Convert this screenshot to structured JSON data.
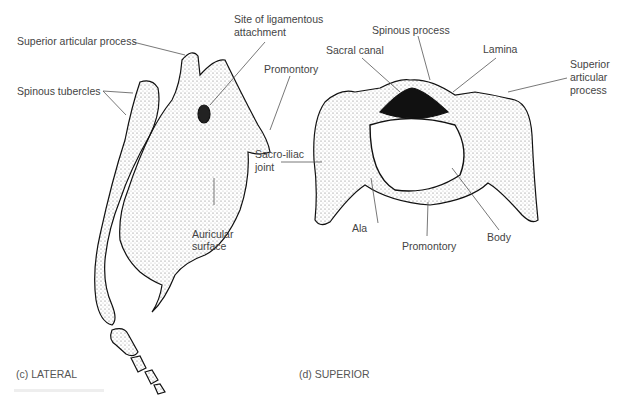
{
  "figure": {
    "panels": [
      {
        "id": "c",
        "caption": "(c) LATERAL",
        "labels": {
          "superior_articular_process": "Superior articular process",
          "site_ligamentous_line1": "Site of ligamentous",
          "site_ligamentous_line2": "attachment",
          "promontory": "Promontory",
          "spinous_tubercles": "Spinous tubercles",
          "auricular_line1": "Auricular",
          "auricular_line2": "surface"
        }
      },
      {
        "id": "d",
        "caption": "(d) SUPERIOR",
        "labels": {
          "spinous_process": "Spinous process",
          "sacral_canal": "Sacral canal",
          "lamina": "Lamina",
          "superior_line1": "Superior",
          "superior_line2": "articular",
          "superior_line3": "process",
          "sacroiliac_line1": "Sacro-iliac",
          "sacroiliac_line2": "joint",
          "ala": "Ala",
          "promontory": "Promontory",
          "body": "Body"
        }
      }
    ]
  }
}
